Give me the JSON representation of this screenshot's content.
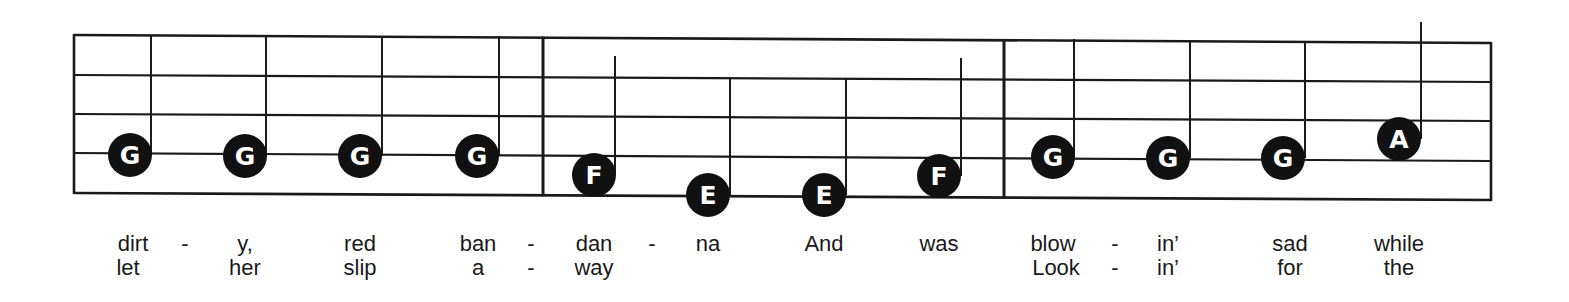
{
  "score": {
    "staff": {
      "left_x": 74,
      "right_x": 1491,
      "lines_left_y": [
        35,
        75,
        114,
        153,
        193
      ],
      "lines_right_y": [
        43,
        82,
        121,
        161,
        200
      ],
      "barlines_x": [
        543,
        1004
      ],
      "color": "#1a1a1a"
    },
    "measures": [
      {
        "notes": [
          {
            "letter": "G",
            "x": 130,
            "y": 155,
            "stem_x": 151,
            "stem_top": 35
          },
          {
            "letter": "G",
            "x": 245,
            "y": 156,
            "stem_x": 266,
            "stem_top": 36
          },
          {
            "letter": "G",
            "x": 360,
            "y": 156,
            "stem_x": 382,
            "stem_top": 36
          },
          {
            "letter": "G",
            "x": 477,
            "y": 156,
            "stem_x": 499,
            "stem_top": 36
          }
        ]
      },
      {
        "notes": [
          {
            "letter": "F",
            "x": 594,
            "y": 175,
            "stem_x": 615,
            "stem_top": 56
          },
          {
            "letter": "E",
            "x": 708,
            "y": 195,
            "stem_x": 730,
            "stem_top": 77
          },
          {
            "letter": "E",
            "x": 824,
            "y": 195,
            "stem_x": 846,
            "stem_top": 78
          },
          {
            "letter": "F",
            "x": 939,
            "y": 176,
            "stem_x": 961,
            "stem_top": 58
          }
        ]
      },
      {
        "notes": [
          {
            "letter": "G",
            "x": 1053,
            "y": 157,
            "stem_x": 1074,
            "stem_top": 39
          },
          {
            "letter": "G",
            "x": 1168,
            "y": 158,
            "stem_x": 1190,
            "stem_top": 40
          },
          {
            "letter": "G",
            "x": 1283,
            "y": 158,
            "stem_x": 1305,
            "stem_top": 41
          },
          {
            "letter": "A",
            "x": 1399,
            "y": 139,
            "stem_x": 1421,
            "stem_top": 22
          }
        ]
      }
    ],
    "lyrics": {
      "verse1": [
        {
          "text": "dirt",
          "x": 133
        },
        {
          "text": "-",
          "x": 185
        },
        {
          "text": "y,",
          "x": 245
        },
        {
          "text": "red",
          "x": 360
        },
        {
          "text": "ban",
          "x": 478
        },
        {
          "text": "-",
          "x": 531
        },
        {
          "text": "dan",
          "x": 594
        },
        {
          "text": "-",
          "x": 652
        },
        {
          "text": "na",
          "x": 708
        },
        {
          "text": "And",
          "x": 824
        },
        {
          "text": "was",
          "x": 939
        },
        {
          "text": "blow",
          "x": 1053
        },
        {
          "text": "-",
          "x": 1115
        },
        {
          "text": "in’",
          "x": 1168
        },
        {
          "text": "sad",
          "x": 1290
        },
        {
          "text": "while",
          "x": 1399
        }
      ],
      "verse2": [
        {
          "text": "let",
          "x": 128
        },
        {
          "text": "her",
          "x": 245
        },
        {
          "text": "slip",
          "x": 360
        },
        {
          "text": "a",
          "x": 478
        },
        {
          "text": "-",
          "x": 531
        },
        {
          "text": "way",
          "x": 594
        },
        {
          "text": "Look",
          "x": 1056
        },
        {
          "text": "-",
          "x": 1115
        },
        {
          "text": "in’",
          "x": 1168
        },
        {
          "text": "for",
          "x": 1290
        },
        {
          "text": "the",
          "x": 1399
        }
      ]
    },
    "lyric_rows_y": [
      233,
      257
    ],
    "note_color": "#111111",
    "note_radius": 22
  }
}
